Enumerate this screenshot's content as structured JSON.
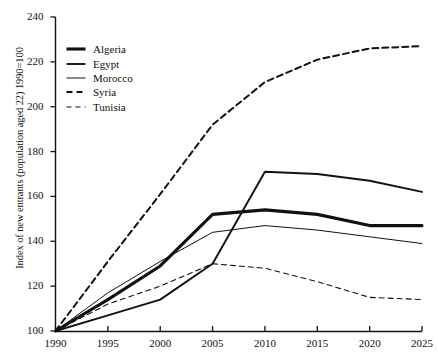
{
  "chart_data": {
    "type": "line",
    "title": "",
    "xlabel": "",
    "ylabel": "Index of new entrants (population aged 22) 1990=100",
    "x": [
      1990,
      1995,
      2000,
      2005,
      2010,
      2015,
      2020,
      2025
    ],
    "xlim": [
      1990,
      2025
    ],
    "ylim": [
      100,
      240
    ],
    "yticks": [
      100,
      120,
      140,
      160,
      180,
      200,
      220,
      240
    ],
    "xticks": [
      1990,
      1995,
      2000,
      2005,
      2010,
      2015,
      2020,
      2025
    ],
    "grid": false,
    "legend_position": "upper left",
    "series": [
      {
        "name": "Algeria",
        "style": "solid-thick",
        "color": "#111111",
        "width": 3.1,
        "dash": "",
        "values": [
          100,
          114,
          129,
          152,
          154,
          152,
          147,
          147
        ]
      },
      {
        "name": "Egypt",
        "style": "solid-medium",
        "color": "#111111",
        "width": 1.9,
        "dash": "",
        "values": [
          100,
          107,
          114,
          130,
          171,
          170,
          167,
          162
        ]
      },
      {
        "name": "Morocco",
        "style": "solid-thin",
        "color": "#111111",
        "width": 1.0,
        "dash": "",
        "values": [
          100,
          117,
          131,
          144,
          147,
          145,
          142,
          139
        ]
      },
      {
        "name": "Syria",
        "style": "dashed-thick",
        "color": "#111111",
        "width": 2.0,
        "dash": "6,4",
        "values": [
          100,
          131,
          161,
          192,
          211,
          221,
          226,
          227
        ]
      },
      {
        "name": "Tunisia",
        "style": "dashed-thin",
        "color": "#111111",
        "width": 1.1,
        "dash": "5,4",
        "values": [
          100,
          112,
          120,
          130,
          128,
          122,
          115,
          114
        ]
      }
    ]
  },
  "axes": {
    "ytick_labels": [
      "240",
      "220",
      "200",
      "180",
      "160",
      "140",
      "120",
      "100"
    ],
    "xtick_labels": [
      "1990",
      "1995",
      "2000",
      "2005",
      "2010",
      "2015",
      "2020",
      "2025"
    ],
    "ylabel": "Index of new entrants (population aged 22) 1990=100"
  },
  "legend": {
    "items": [
      {
        "label": "Algeria"
      },
      {
        "label": "Egypt"
      },
      {
        "label": "Morocco"
      },
      {
        "label": "Syria"
      },
      {
        "label": "Tunisia"
      }
    ]
  }
}
